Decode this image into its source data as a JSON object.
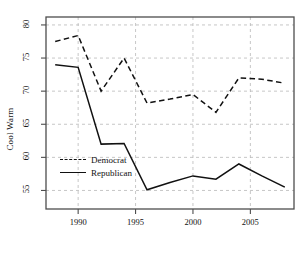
{
  "chart_data": {
    "type": "line",
    "title": "",
    "subtitle": "",
    "xlabel": "",
    "ylabel": "Cool Warm",
    "xlim": [
      1987.2,
      2008.8
    ],
    "ylim": [
      52.2,
      81.2
    ],
    "grid": true,
    "legend_position": "inside lower-left",
    "x": [
      1988,
      1990,
      1992,
      1994,
      1996,
      1998,
      2000,
      2002,
      2004,
      2006,
      2008
    ],
    "xticks": [
      1990,
      1995,
      2000,
      2005
    ],
    "xtick_labels": [
      "1990",
      "1995",
      "2000",
      "2005"
    ],
    "yticks": [
      55,
      60,
      65,
      70,
      75,
      80
    ],
    "ytick_labels": [
      "55",
      "60",
      "65",
      "70",
      "75",
      "80"
    ],
    "series": [
      {
        "name": "Democrat",
        "style": "dashed",
        "color": "#111111",
        "values": [
          77.5,
          78.4,
          70.0,
          75.0,
          68.2,
          68.8,
          69.5,
          66.8,
          72.0,
          71.8,
          71.2
        ]
      },
      {
        "name": "Republican",
        "style": "solid",
        "color": "#111111",
        "values": [
          74.0,
          73.6,
          62.0,
          62.1,
          55.1,
          56.2,
          57.2,
          56.7,
          59.0,
          57.2,
          55.5
        ]
      }
    ]
  },
  "legend": {
    "entries": [
      {
        "label": "Democrat"
      },
      {
        "label": "Republican"
      }
    ]
  },
  "axis": {
    "y_title": "Cool Warm"
  },
  "colors": {
    "line": "#111111",
    "grid": "#b9b9b9",
    "frame": "#4d4d4d",
    "background": "#ffffff"
  }
}
